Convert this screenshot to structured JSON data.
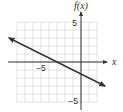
{
  "chart_data": {
    "type": "line",
    "title": "",
    "xlabel": "x",
    "ylabel": "f(x)",
    "xlim": [
      -8,
      2
    ],
    "ylim": [
      -5,
      5
    ],
    "grid": true,
    "grid_step": 1,
    "x_tick_labels": [
      {
        "value": -5,
        "label": "−5"
      }
    ],
    "y_tick_labels": [
      {
        "value": 5,
        "label": "5"
      },
      {
        "value": -5,
        "label": "−5"
      }
    ],
    "series": [
      {
        "name": "f(x)",
        "equation": "f(x) = -x/2 - 3/2",
        "slope": -0.5,
        "y_intercept": -1.5,
        "x_intercept": -3,
        "points": [
          {
            "x": -9,
            "y": 3
          },
          {
            "x": -3,
            "y": 0
          },
          {
            "x": 0,
            "y": -1.5
          },
          {
            "x": 3,
            "y": -3
          }
        ],
        "arrows_both_ends": true
      }
    ]
  },
  "labels": {
    "x_axis": "x",
    "y_axis": "f(x)",
    "x_tick_neg5": "−5",
    "y_tick_5": "5",
    "y_tick_neg5": "−5"
  }
}
